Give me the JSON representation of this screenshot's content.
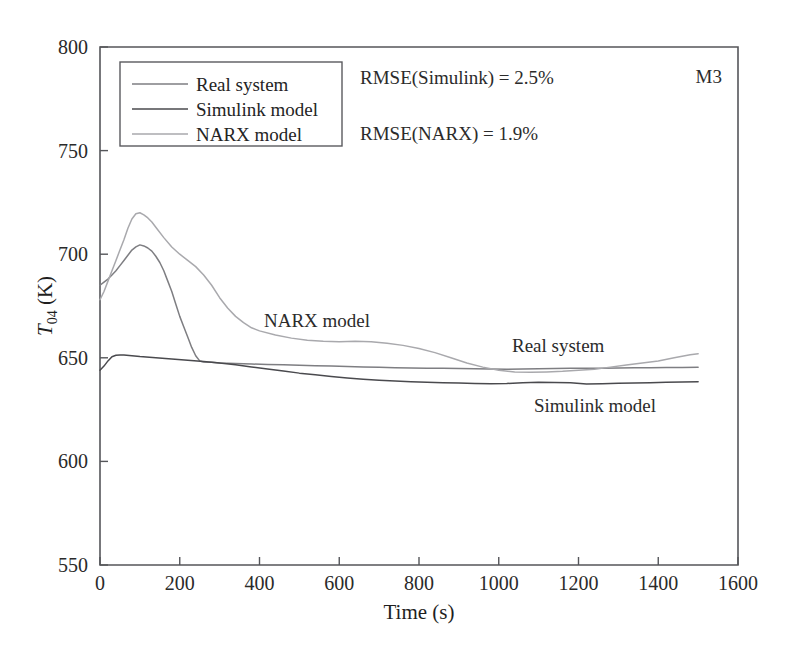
{
  "chart_data": {
    "type": "line",
    "title": "",
    "corner_label": "M3",
    "xlabel": "Time (s)",
    "ylabel": "T04 (K)",
    "ylabel_parts": {
      "symbol": "T",
      "subscript": "04",
      "unit": "(K)"
    },
    "xlim": [
      0,
      1600
    ],
    "ylim": [
      550,
      800
    ],
    "xticks": [
      0,
      200,
      400,
      600,
      800,
      1000,
      1200,
      1400,
      1600
    ],
    "yticks": [
      550,
      600,
      650,
      700,
      750,
      800
    ],
    "grid": false,
    "legend_position": "top-left",
    "annotations": [
      {
        "text": "RMSE(Simulink) = 2.5%",
        "x": 360,
        "y": 84
      },
      {
        "text": "RMSE(NARX) = 1.9%",
        "x": 360,
        "y": 140
      },
      {
        "text": "NARX model",
        "x": 264,
        "y": 327
      },
      {
        "text": "Real system",
        "x": 512,
        "y": 352
      },
      {
        "text": "Simulink model",
        "x": 534,
        "y": 412
      }
    ],
    "legend": [
      {
        "name": "Real system",
        "color": "#7e7e82"
      },
      {
        "name": "Simulink model",
        "color": "#4a4a4e"
      },
      {
        "name": "NARX model",
        "color": "#a9a9ad"
      }
    ],
    "series": [
      {
        "name": "Real system",
        "color": "#7e7e82",
        "width": 1.5,
        "x": [
          0,
          10,
          20,
          30,
          40,
          50,
          60,
          70,
          80,
          90,
          100,
          110,
          120,
          130,
          140,
          150,
          160,
          170,
          180,
          190,
          200,
          210,
          220,
          230,
          240,
          250,
          260,
          280,
          300,
          340,
          380,
          420,
          460,
          500,
          540,
          580,
          620,
          660,
          700,
          740,
          780,
          820,
          860,
          900,
          940,
          980,
          1020,
          1060,
          1100,
          1140,
          1180,
          1220,
          1260,
          1300,
          1340,
          1380,
          1420,
          1460,
          1500
        ],
        "y": [
          685,
          686.5,
          688,
          690,
          692,
          694.5,
          697,
          699.5,
          702,
          703.5,
          704.5,
          704,
          703,
          701.5,
          699,
          696,
          692,
          687,
          682,
          676,
          670,
          665,
          660,
          655,
          651,
          648.5,
          648,
          647.8,
          647.5,
          647.2,
          647,
          646.8,
          646.6,
          646.4,
          646.2,
          646,
          645.8,
          645.6,
          645.4,
          645.2,
          645.1,
          645,
          644.9,
          644.8,
          644.7,
          644.6,
          644.5,
          644.6,
          644.7,
          644.8,
          644.9,
          645,
          645,
          645.1,
          645.2,
          645.2,
          645.3,
          645.3,
          645.4
        ]
      },
      {
        "name": "Simulink model",
        "color": "#4a4a4e",
        "width": 1.5,
        "x": [
          0,
          10,
          20,
          30,
          40,
          50,
          60,
          80,
          100,
          140,
          180,
          220,
          260,
          300,
          340,
          380,
          420,
          460,
          500,
          540,
          580,
          620,
          660,
          700,
          740,
          780,
          820,
          860,
          900,
          940,
          980,
          1020,
          1060,
          1100,
          1140,
          1180,
          1220,
          1260,
          1300,
          1340,
          1380,
          1420,
          1460,
          1500
        ],
        "y": [
          644,
          646,
          648.5,
          650.5,
          651.2,
          651.4,
          651.3,
          651,
          650.6,
          650,
          649.4,
          648.8,
          648.2,
          647.5,
          646.6,
          645.6,
          644.6,
          643.6,
          642.6,
          641.8,
          641,
          640.3,
          639.7,
          639.2,
          638.8,
          638.5,
          638.2,
          638,
          637.8,
          637.6,
          637.5,
          637.6,
          638,
          638.2,
          638.1,
          638,
          637.3,
          637.5,
          637.7,
          637.8,
          638,
          638.2,
          638.3,
          638.4
        ]
      },
      {
        "name": "NARX model",
        "color": "#a9a9ad",
        "width": 1.5,
        "x": [
          0,
          10,
          20,
          30,
          40,
          50,
          60,
          70,
          80,
          90,
          100,
          110,
          120,
          130,
          140,
          160,
          180,
          200,
          220,
          240,
          260,
          280,
          300,
          320,
          340,
          360,
          380,
          400,
          440,
          480,
          520,
          560,
          600,
          640,
          680,
          720,
          760,
          800,
          840,
          880,
          920,
          960,
          1000,
          1040,
          1080,
          1120,
          1160,
          1200,
          1240,
          1280,
          1320,
          1360,
          1400,
          1440,
          1480,
          1500
        ],
        "y": [
          678,
          682,
          687,
          692,
          697,
          702,
          707,
          712.5,
          717,
          719.5,
          720,
          719,
          717.5,
          715.5,
          713,
          708,
          703.5,
          700,
          697,
          694,
          690,
          685,
          679,
          674,
          670,
          667,
          664.5,
          663,
          661,
          659.5,
          658.5,
          658,
          657.8,
          658,
          657.8,
          657,
          656,
          654.5,
          652.5,
          650,
          647.5,
          645.5,
          644,
          643.2,
          643,
          643.2,
          643.5,
          644,
          644.5,
          645.5,
          646.5,
          647.5,
          648.5,
          650,
          651.5,
          652
        ]
      }
    ]
  },
  "plot_geometry": {
    "left": 100,
    "right": 738,
    "top": 47,
    "bottom": 565,
    "data_x_end": 1500
  },
  "legend_box": {
    "x": 120,
    "y": 62,
    "width": 222,
    "height": 84
  }
}
